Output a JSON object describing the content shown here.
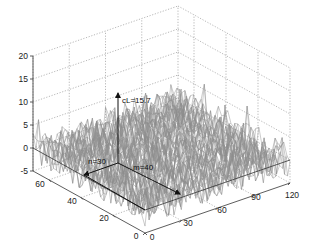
{
  "chart_data": {
    "type": "surface3d",
    "title": "",
    "axes": {
      "x": {
        "label": "",
        "ticks": [
          0,
          30,
          60,
          90,
          120
        ],
        "range": [
          0,
          120
        ]
      },
      "y": {
        "label": "",
        "ticks": [
          0,
          20,
          40,
          60
        ],
        "range": [
          0,
          70
        ]
      },
      "z": {
        "label": "",
        "ticks": [
          -5,
          0,
          5,
          10,
          15,
          20
        ],
        "range": [
          -5,
          20
        ]
      }
    },
    "grid": true,
    "annotations": [
      {
        "text": "cL=15.7",
        "type": "vertical-arrow",
        "position": {
          "m": 40,
          "n": 30
        },
        "value": 15.7
      },
      {
        "text": "n=30",
        "type": "arrow",
        "along": "y"
      },
      {
        "text": "m=40",
        "type": "arrow",
        "along": "x"
      }
    ],
    "surface": {
      "style": "gray wireframe mesh",
      "mean_level": 0,
      "noise_amplitude_approx": 5
    }
  },
  "labels": {
    "z_ticks": [
      "20",
      "15",
      "10",
      "5",
      "0",
      "-5"
    ],
    "x_ticks": [
      "0",
      "30",
      "60",
      "90",
      "120"
    ],
    "y_ticks": [
      "0",
      "20",
      "40",
      "60"
    ],
    "peak": "cL=15.7",
    "n_label": "n=30",
    "m_label": "m=40"
  }
}
